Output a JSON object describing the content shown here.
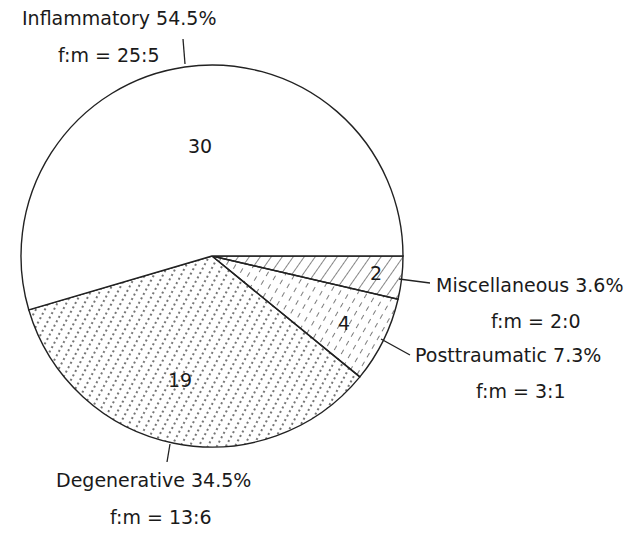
{
  "chart_data": {
    "type": "pie",
    "title": "",
    "total": 55,
    "start": "3 o'clock, clockwise",
    "slices": [
      {
        "name": "Miscellaneous",
        "value": 2,
        "percent_label": "3.6%",
        "ratio_label": "f:m = 2:0",
        "pattern": "diagonal-hatch"
      },
      {
        "name": "Posttraumatic",
        "value": 4,
        "percent_label": "7.3%",
        "ratio_label": "f:m = 3:1",
        "pattern": "dashed-hatch"
      },
      {
        "name": "Degenerative",
        "value": 19,
        "percent_label": "34.5%",
        "ratio_label": "f:m = 13:6",
        "pattern": "dotted-lines"
      },
      {
        "name": "Inflammatory",
        "value": 30,
        "percent_label": "54.5%",
        "ratio_label": "f:m = 25:5",
        "pattern": "none"
      }
    ],
    "labels": {
      "misc": {
        "title": "Miscellaneous 3.6%",
        "ratio": "f:m = 2:0",
        "count": "2"
      },
      "post": {
        "title": "Posttraumatic 7.3%",
        "ratio": "f:m = 3:1",
        "count": "4"
      },
      "degen": {
        "title": "Degenerative 34.5%",
        "ratio": "f:m = 13:6",
        "count": "19"
      },
      "infl": {
        "title": "Inflammatory 54.5%",
        "ratio": "f:m = 25:5",
        "count": "30"
      }
    },
    "legend": "none (callout labels)"
  }
}
